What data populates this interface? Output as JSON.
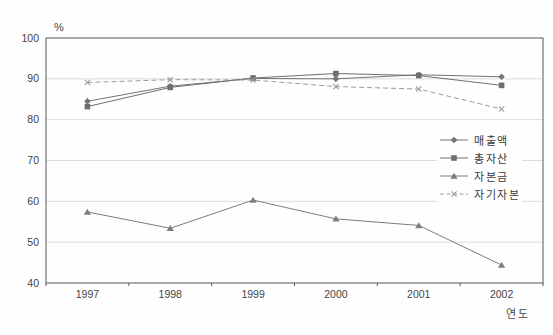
{
  "chart_data": {
    "type": "line",
    "title": "",
    "categories": [
      "1997",
      "1998",
      "1999",
      "2000",
      "2001",
      "2002"
    ],
    "series": [
      {
        "name": "매출액",
        "marker": "diamond",
        "line_style": "solid",
        "color": "#747474",
        "values": [
          84.5,
          88.2,
          90.1,
          90.0,
          91.0,
          90.5
        ]
      },
      {
        "name": "총자산",
        "marker": "square",
        "line_style": "solid",
        "color": "#6e6e6e",
        "values": [
          83.2,
          87.9,
          90.2,
          91.3,
          90.8,
          88.4
        ]
      },
      {
        "name": "자본금",
        "marker": "triangle",
        "line_style": "solid",
        "color": "#7d7d7d",
        "values": [
          57.4,
          53.4,
          60.3,
          55.7,
          54.1,
          44.4
        ]
      },
      {
        "name": "자기자본",
        "marker": "x",
        "line_style": "dashed",
        "color": "#9b9b9b",
        "values": [
          89.1,
          89.8,
          89.7,
          88.1,
          87.5,
          82.6
        ]
      }
    ],
    "xlabel": "연도",
    "ylabel": "%",
    "ylim": [
      40,
      100
    ],
    "yticks": [
      40,
      50,
      60,
      70,
      80,
      90,
      100
    ],
    "grid": "horizontal",
    "legend_position": "center-right-inside",
    "colors": {
      "grid": "#dcdcdc",
      "axis": "#565656",
      "tick_text": "#454545"
    }
  }
}
